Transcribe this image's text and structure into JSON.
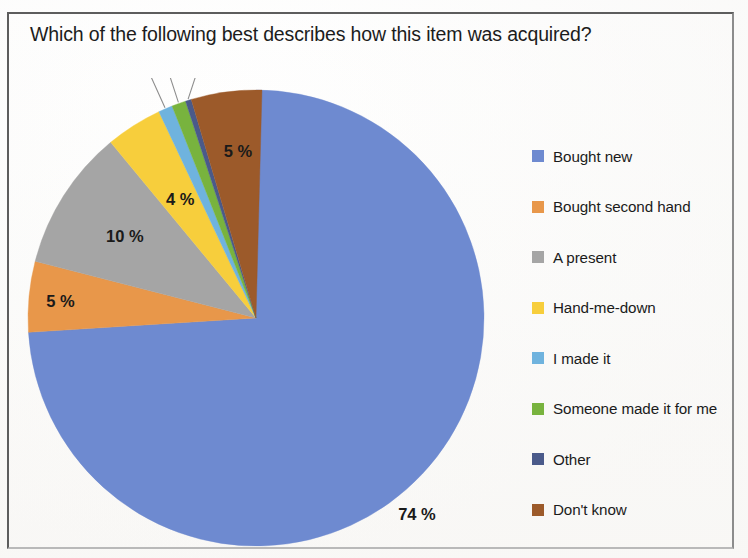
{
  "chart_data": {
    "type": "pie",
    "title": "Which of the following best describes how this item was acquired?",
    "categories": [
      "Bought new",
      "Bought second hand",
      "A present",
      "Hand-me-down",
      "I made it",
      "Someone made it for me",
      "Other",
      "Don't know"
    ],
    "values": [
      74,
      5,
      10,
      4,
      1,
      1,
      0,
      5
    ],
    "value_labels": [
      "74 %",
      "5 %",
      "10 %",
      "4 %",
      "1 %",
      "1 %",
      "0 %",
      "5 %"
    ],
    "colors": [
      "#6E8AD0",
      "#E8974A",
      "#A5A5A5",
      "#F7CE3C",
      "#6FB3DE",
      "#78B33E",
      "#4A5A8A",
      "#9C5A2A"
    ],
    "unit": "%",
    "start_angle_deg": 0,
    "direction": "clockwise",
    "legend_position": "right",
    "grid": false,
    "xlabel": "",
    "ylabel": ""
  },
  "chart": {
    "title": "Which of the following best describes how this item was acquired?",
    "slices": [
      {
        "label": "Bought new",
        "value": 74,
        "value_label": "74 %",
        "color": "#6E8AD0"
      },
      {
        "label": "Bought second hand",
        "value": 5,
        "value_label": "5 %",
        "color": "#E8974A"
      },
      {
        "label": "A present",
        "value": 10,
        "value_label": "10 %",
        "color": "#A5A5A5"
      },
      {
        "label": "Hand-me-down",
        "value": 4,
        "value_label": "4 %",
        "color": "#F7CE3C"
      },
      {
        "label": "I made it",
        "value": 1,
        "value_label": "1 %",
        "color": "#6FB3DE"
      },
      {
        "label": "Someone made it for me",
        "value": 1,
        "value_label": "1 %",
        "color": "#78B33E"
      },
      {
        "label": "Other",
        "value": 0,
        "value_label": "0 %",
        "color": "#4A5A8A"
      },
      {
        "label": "Don't know",
        "value": 5,
        "value_label": "5 %",
        "color": "#9C5A2A"
      }
    ]
  },
  "legend": {
    "items": [
      {
        "label": "Bought new",
        "color": "#6E8AD0"
      },
      {
        "label": "Bought second hand",
        "color": "#E8974A"
      },
      {
        "label": "A present",
        "color": "#A5A5A5"
      },
      {
        "label": "Hand-me-down",
        "color": "#F7CE3C"
      },
      {
        "label": "I made it",
        "color": "#6FB3DE"
      },
      {
        "label": "Someone made it for me",
        "color": "#78B33E"
      },
      {
        "label": "Other",
        "color": "#4A5A8A"
      },
      {
        "label": "Don't know",
        "color": "#9C5A2A"
      }
    ]
  }
}
